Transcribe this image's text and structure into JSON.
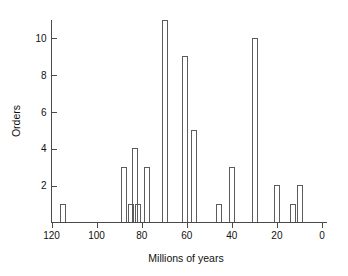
{
  "chart_data": {
    "type": "bar",
    "title": "",
    "subtitle": "",
    "xlabel": "Millions of years",
    "ylabel": "Orders",
    "xlim": [
      120,
      0
    ],
    "ylim": [
      0,
      11
    ],
    "x_axis_reversed": true,
    "grid": false,
    "legend": null,
    "xticks": [
      120,
      100,
      80,
      60,
      40,
      20,
      0
    ],
    "xtick_labels": [
      "120",
      "100",
      "80",
      "60",
      "40",
      "20",
      "0"
    ],
    "yticks": [
      2,
      4,
      6,
      8,
      10
    ],
    "ytick_labels": [
      "2",
      "4",
      "6",
      "8",
      "10"
    ],
    "bar_width_myr": 2.2,
    "categories": [
      115,
      88,
      85,
      83,
      82,
      78,
      70,
      61,
      57,
      46,
      40,
      30,
      20,
      13,
      10
    ],
    "values": [
      1,
      3,
      1,
      4,
      1,
      3,
      11,
      9,
      5,
      1,
      3,
      10,
      2,
      1,
      2
    ],
    "bars": [
      {
        "x": 115,
        "height": 1
      },
      {
        "x": 88,
        "height": 3
      },
      {
        "x": 85,
        "height": 1
      },
      {
        "x": 83,
        "height": 4
      },
      {
        "x": 82,
        "height": 1
      },
      {
        "x": 78,
        "height": 3
      },
      {
        "x": 70,
        "height": 11
      },
      {
        "x": 61,
        "height": 9
      },
      {
        "x": 57,
        "height": 5
      },
      {
        "x": 46,
        "height": 1
      },
      {
        "x": 40,
        "height": 3
      },
      {
        "x": 30,
        "height": 10
      },
      {
        "x": 20,
        "height": 2
      },
      {
        "x": 13,
        "height": 1
      },
      {
        "x": 10,
        "height": 2
      }
    ],
    "colors": {
      "background": "#ffffff",
      "axis": "#4a4a4a",
      "bar_stroke": "#5c5c5c",
      "text": "#111111"
    }
  }
}
